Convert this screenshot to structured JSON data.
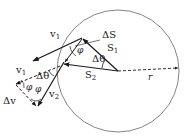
{
  "diagram": {
    "colors": {
      "ink": "#1a1a1a",
      "circle": "#777777",
      "background": "#ffffff"
    },
    "labels": {
      "v1_top": "v",
      "v1_top_sub": "1",
      "delta_s": "ΔS",
      "phi_top": "φ",
      "s1": "S",
      "s1_sub": "1",
      "delta_theta_top": "Δθ",
      "s2": "S",
      "s2_sub": "2",
      "r": "r",
      "v1_bottom": "v",
      "v1_bottom_sub": "1",
      "delta_theta_bottom": "Δθ",
      "phi_left": "φ",
      "phi_right": "φ",
      "delta_v": "Δv",
      "v2": "v",
      "v2_sub": "2"
    }
  }
}
